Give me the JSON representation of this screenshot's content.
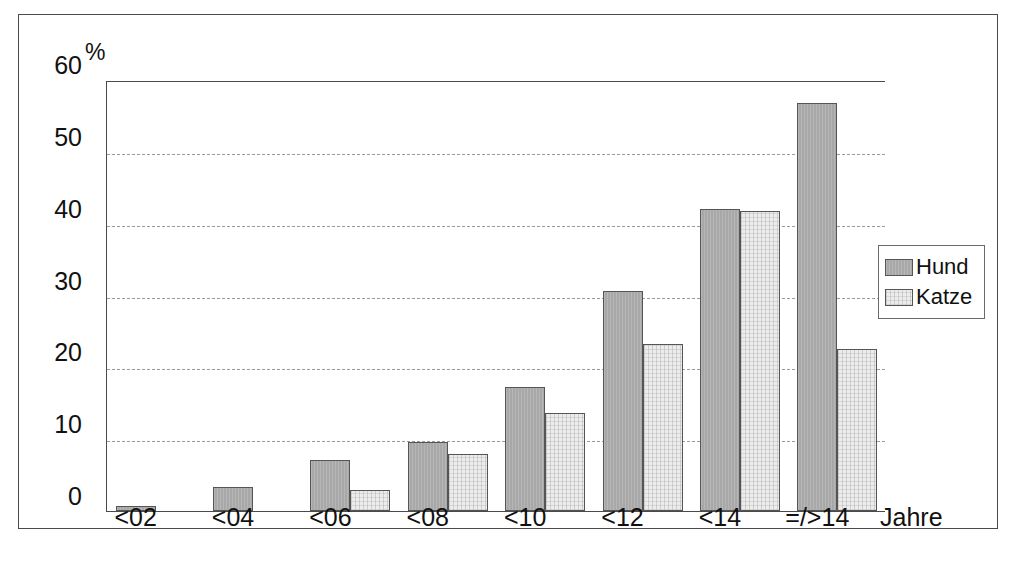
{
  "chart_data": {
    "type": "bar",
    "title": "",
    "subtitle": "",
    "xlabel": "Jahre",
    "ylabel": "%",
    "ylim": [
      0,
      60
    ],
    "y_ticks": [
      0,
      10,
      20,
      30,
      40,
      50,
      60
    ],
    "grid": true,
    "legend_position": "right",
    "categories": [
      "<02",
      "<04",
      "<06",
      "<08",
      "<10",
      "<12",
      "<14",
      "=/>14"
    ],
    "series": [
      {
        "name": "Hund",
        "color": "#a8a8a8",
        "values": [
          0.7,
          3.3,
          7.1,
          9.6,
          17.3,
          30.6,
          42.1,
          56.8
        ]
      },
      {
        "name": "Katze",
        "color": "#ececec",
        "values": [
          0,
          0,
          2.9,
          8.0,
          13.7,
          23.2,
          41.7,
          22.6
        ]
      }
    ]
  },
  "axis": {
    "y_unit_label": "%",
    "x_title": "Jahre"
  },
  "legend": {
    "entries": [
      {
        "label": "Hund",
        "swatch": "hund"
      },
      {
        "label": "Katze",
        "swatch": "katze"
      }
    ]
  },
  "caption": {
    "text": ""
  }
}
